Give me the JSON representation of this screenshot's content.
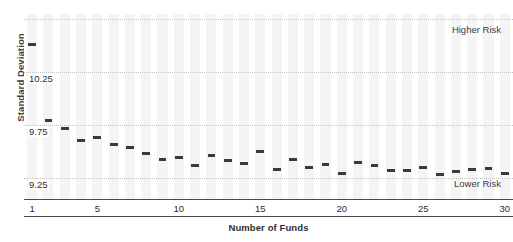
{
  "chart_data": {
    "type": "scatter",
    "title": "",
    "xlabel": "Number of Funds",
    "ylabel": "Standard Deviation",
    "x": [
      1,
      2,
      3,
      4,
      5,
      6,
      7,
      8,
      9,
      10,
      11,
      12,
      13,
      14,
      15,
      16,
      17,
      18,
      19,
      20,
      21,
      22,
      23,
      24,
      25,
      26,
      27,
      28,
      29,
      30
    ],
    "values": [
      10.51,
      9.79,
      9.72,
      9.6,
      9.63,
      9.57,
      9.54,
      9.48,
      9.42,
      9.44,
      9.37,
      9.46,
      9.41,
      9.39,
      9.5,
      9.33,
      9.42,
      9.35,
      9.38,
      9.29,
      9.4,
      9.37,
      9.32,
      9.32,
      9.35,
      9.28,
      9.31,
      9.33,
      9.34,
      9.29
    ],
    "categories": [
      "1",
      "2",
      "3",
      "4",
      "5",
      "6",
      "7",
      "8",
      "9",
      "10",
      "11",
      "12",
      "13",
      "14",
      "15",
      "16",
      "17",
      "18",
      "19",
      "20",
      "21",
      "22",
      "23",
      "24",
      "25",
      "26",
      "27",
      "28",
      "29",
      "30"
    ],
    "xticks": [
      1,
      5,
      10,
      15,
      20,
      25,
      30
    ],
    "xtick_labels": [
      "1",
      "5",
      "10",
      "15",
      "20",
      "25",
      "30"
    ],
    "yticks": [
      9.25,
      9.75,
      10.25
    ],
    "ytick_labels": [
      "9.25",
      "9.75",
      "10.25"
    ],
    "gridlines": [
      9.25,
      9.75,
      10.25,
      10.75
    ],
    "ylim": [
      9.05,
      10.8
    ],
    "xlim": [
      0.5,
      30.5
    ],
    "grid": true,
    "legend": "none",
    "marker_color": "#3a3a3a",
    "grid_color": "#c2c2c2",
    "band_color": "#f4f4f4",
    "annotations": [
      {
        "text": "Higher Risk",
        "position": "top-right"
      },
      {
        "text": "Lower Risk",
        "position": "bottom-right"
      }
    ]
  },
  "labels": {
    "y_axis_title": "Standard Deviation",
    "x_axis_title": "Number of Funds",
    "higher_risk": "Higher Risk",
    "lower_risk": "Lower Risk"
  }
}
